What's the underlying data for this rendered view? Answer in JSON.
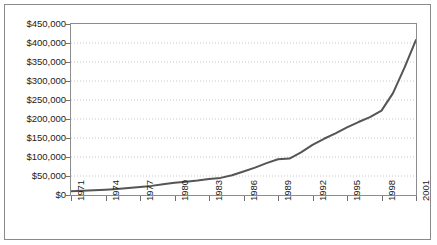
{
  "chart_data": {
    "type": "line",
    "title": "",
    "subtitle": "",
    "xlabel": "",
    "ylabel": "",
    "grid": "horizontal-dotted",
    "legend": "none",
    "xlim": [
      1971,
      2001
    ],
    "ylim": [
      0,
      450000
    ],
    "y_ticks": [
      0,
      50000,
      100000,
      150000,
      200000,
      250000,
      300000,
      350000,
      400000,
      450000
    ],
    "y_tick_labels": [
      "$0",
      "$50,000",
      "$100,000",
      "$150,000",
      "$200,000",
      "$250,000",
      "$300,000",
      "$350,000",
      "$400,000",
      "$450,000"
    ],
    "x_ticks": [
      1971,
      1974,
      1977,
      1980,
      1983,
      1986,
      1989,
      1992,
      1995,
      1998,
      2001
    ],
    "x_tick_labels": [
      "1971",
      "1974",
      "1977",
      "1980",
      "1983",
      "1986",
      "1989",
      "1992",
      "1995",
      "1998",
      "2001"
    ],
    "x": [
      1971,
      1972,
      1973,
      1974,
      1975,
      1976,
      1977,
      1978,
      1979,
      1980,
      1981,
      1982,
      1983,
      1984,
      1985,
      1986,
      1987,
      1988,
      1989,
      1990,
      1991,
      1992,
      1993,
      1994,
      1995,
      1996,
      1997,
      1998,
      1999,
      2000,
      2001
    ],
    "values": [
      10000,
      11000,
      12500,
      14000,
      16000,
      18500,
      21000,
      24000,
      28000,
      32000,
      35000,
      38000,
      42000,
      45000,
      52000,
      62000,
      72000,
      84000,
      94000,
      96000,
      112000,
      132000,
      148000,
      162000,
      178000,
      192000,
      205000,
      222000,
      268000,
      335000,
      408000
    ],
    "line_color": "#555555",
    "line_width": 2,
    "grid_color": "#c8c8c8",
    "axis_color": "#8d8d8d",
    "background": "#ffffff"
  }
}
